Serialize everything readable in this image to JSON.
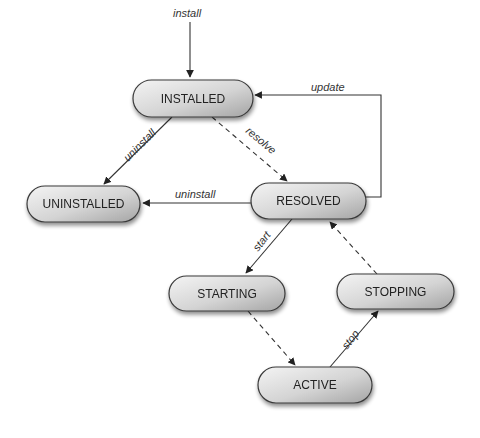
{
  "diagram": {
    "type": "state-machine",
    "colors": {
      "node_fill_light": "#f2f2f2",
      "node_fill_dark": "#a8a8a8",
      "node_stroke": "#3a3a3a",
      "edge": "#333333",
      "text": "#222222"
    },
    "nodes": [
      {
        "id": "installed",
        "label": "INSTALLED",
        "x": 133,
        "y": 80,
        "w": 120,
        "h": 37
      },
      {
        "id": "uninstalled",
        "label": "UNINSTALLED",
        "x": 27,
        "y": 186,
        "w": 113,
        "h": 36
      },
      {
        "id": "resolved",
        "label": "RESOLVED",
        "x": 251,
        "y": 183,
        "w": 115,
        "h": 36
      },
      {
        "id": "starting",
        "label": "STARTING",
        "x": 169,
        "y": 276,
        "w": 116,
        "h": 35
      },
      {
        "id": "stopping",
        "label": "STOPPING",
        "x": 337,
        "y": 274,
        "w": 117,
        "h": 35
      },
      {
        "id": "active",
        "label": "ACTIVE",
        "x": 258,
        "y": 367,
        "w": 114,
        "h": 36
      }
    ],
    "edges": [
      {
        "id": "install",
        "label": "install",
        "from": null,
        "to": "installed",
        "style": "solid"
      },
      {
        "id": "uninstall-installed",
        "label": "uninstall",
        "from": "installed",
        "to": "uninstalled",
        "style": "solid"
      },
      {
        "id": "resolve",
        "label": "resolve",
        "from": "installed",
        "to": "resolved",
        "style": "dashed"
      },
      {
        "id": "uninstall-resolved",
        "label": "uninstall",
        "from": "resolved",
        "to": "uninstalled",
        "style": "solid"
      },
      {
        "id": "update",
        "label": "update",
        "from": "resolved",
        "to": "installed",
        "style": "solid"
      },
      {
        "id": "start",
        "label": "start",
        "from": "resolved",
        "to": "starting",
        "style": "solid"
      },
      {
        "id": "starting-active",
        "label": "",
        "from": "starting",
        "to": "active",
        "style": "dashed"
      },
      {
        "id": "stop",
        "label": "stop",
        "from": "active",
        "to": "stopping",
        "style": "solid"
      },
      {
        "id": "stopping-resolved",
        "label": "",
        "from": "stopping",
        "to": "resolved",
        "style": "dashed"
      }
    ]
  }
}
